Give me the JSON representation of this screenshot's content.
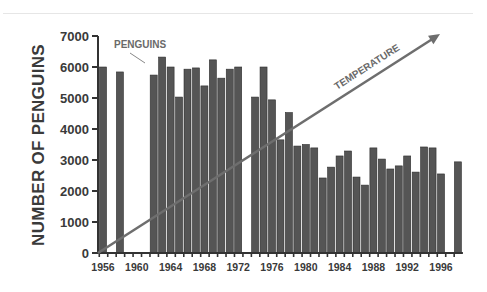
{
  "chart_data": {
    "type": "bar",
    "title": "",
    "xlabel": "",
    "ylabel": "NUMBER OF PENGUINS",
    "ylim": [
      0,
      7000
    ],
    "yticks": [
      0,
      1000,
      2000,
      3000,
      4000,
      5000,
      6000,
      7000
    ],
    "ytick_labels": [
      "0",
      "1000",
      "2000",
      "3000",
      "4000",
      "5000",
      "6000",
      "7000"
    ],
    "xlim": [
      1956,
      1998
    ],
    "xtick_labels": [
      "1956",
      "1960",
      "1964",
      "1968",
      "1972",
      "1976",
      "1980",
      "1984",
      "1988",
      "1992",
      "1996"
    ],
    "grid": false,
    "series": [
      {
        "name": "PENGUINS",
        "color": "#555555",
        "x": [
          1956,
          1958,
          1962,
          1963,
          1964,
          1965,
          1966,
          1967,
          1968,
          1969,
          1970,
          1971,
          1972,
          1974,
          1975,
          1976,
          1977,
          1978,
          1979,
          1980,
          1981,
          1982,
          1983,
          1984,
          1985,
          1986,
          1987,
          1988,
          1989,
          1990,
          1991,
          1992,
          1993,
          1994,
          1995,
          1996,
          1998
        ],
        "values": [
          6000,
          5840,
          5740,
          6320,
          6000,
          5030,
          5930,
          5970,
          5390,
          6230,
          5640,
          5930,
          6000,
          5030,
          6000,
          4940,
          3650,
          4530,
          3450,
          3500,
          3390,
          2420,
          2770,
          3130,
          3290,
          2450,
          2190,
          3390,
          3030,
          2710,
          2810,
          3130,
          2610,
          3420,
          3390,
          2550,
          2940
        ]
      }
    ],
    "annotations": [
      {
        "text": "PENGUINS",
        "target": "1962 bar",
        "kind": "label-with-pointer"
      },
      {
        "text": "TEMPERATURE",
        "kind": "trend-arrow",
        "direction": "increasing",
        "from": {
          "x": 1956,
          "y": 0
        },
        "to": {
          "x": 1997,
          "y": 7000
        },
        "color": "#6e6e6e"
      }
    ]
  }
}
